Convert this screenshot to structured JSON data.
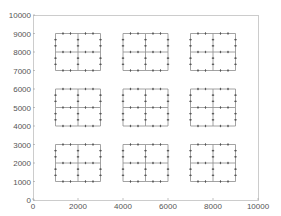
{
  "chart_data": {
    "type": "line",
    "title": "",
    "xlabel": "",
    "ylabel": "",
    "xlim": [
      0,
      10000
    ],
    "ylim": [
      0,
      10000
    ],
    "grid": false,
    "legend": null,
    "xticks": [
      0,
      2000,
      4000,
      6000,
      8000,
      10000
    ],
    "yticks": [
      0,
      1000,
      2000,
      3000,
      4000,
      5000,
      6000,
      7000,
      8000,
      9000,
      10000
    ],
    "xtick_labels": [
      "0",
      "2000",
      "4000",
      "6000",
      "8000",
      "10000"
    ],
    "ytick_labels": [
      "0",
      "1000",
      "2000",
      "3000",
      "4000",
      "5000",
      "6000",
      "7000",
      "8000",
      "9000",
      "10000"
    ],
    "blocks": [
      {
        "x0": 1000,
        "y0": 7000,
        "x1": 3000,
        "y1": 9000
      },
      {
        "x0": 4000,
        "y0": 7000,
        "x1": 6000,
        "y1": 9000
      },
      {
        "x0": 7000,
        "y0": 7000,
        "x1": 9000,
        "y1": 9000
      },
      {
        "x0": 1000,
        "y0": 4000,
        "x1": 3000,
        "y1": 6000
      },
      {
        "x0": 4000,
        "y0": 4000,
        "x1": 6000,
        "y1": 6000
      },
      {
        "x0": 7000,
        "y0": 4000,
        "x1": 9000,
        "y1": 6000
      },
      {
        "x0": 1000,
        "y0": 1000,
        "x1": 3000,
        "y1": 3000
      },
      {
        "x0": 4000,
        "y0": 1000,
        "x1": 6000,
        "y1": 3000
      },
      {
        "x0": 7000,
        "y0": 1000,
        "x1": 9000,
        "y1": 3000
      }
    ],
    "marker_fractions": [
      0.3333,
      0.6667
    ],
    "colors": {
      "line": "#8c8c8c",
      "marker": "#555555",
      "axis": "#cccccc"
    }
  }
}
